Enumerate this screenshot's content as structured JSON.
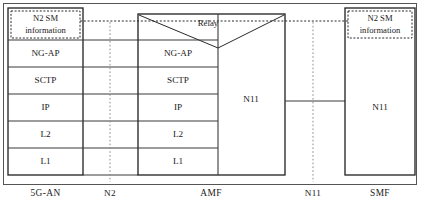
{
  "diagram": {
    "type": "protocol-stack",
    "width": 424,
    "height": 204,
    "colors": {
      "background": "#ffffff",
      "stroke": "#1f1f1f",
      "text": "#1a1a1a",
      "reference_line": "#8a8a8a"
    },
    "relay": {
      "label": "Relay"
    },
    "nodes": [
      {
        "id": "5g-an",
        "entity_label": "5G-AN",
        "sm_box_label_line1": "N2 SM",
        "sm_box_label_line2": "information",
        "layers": [
          "NG-AP",
          "SCTP",
          "IP",
          "L2",
          "L1"
        ]
      },
      {
        "id": "amf",
        "entity_label": "AMF",
        "layers": [
          "NG-AP",
          "SCTP",
          "IP",
          "L2",
          "L1"
        ],
        "right_column_label": "N11"
      },
      {
        "id": "smf",
        "entity_label": "SMF",
        "sm_box_label_line1": "N2 SM",
        "sm_box_label_line2": "information",
        "body_label": "N11"
      }
    ],
    "interfaces": [
      {
        "id": "n2",
        "label": "N2"
      },
      {
        "id": "n11",
        "label": "N11"
      }
    ]
  }
}
